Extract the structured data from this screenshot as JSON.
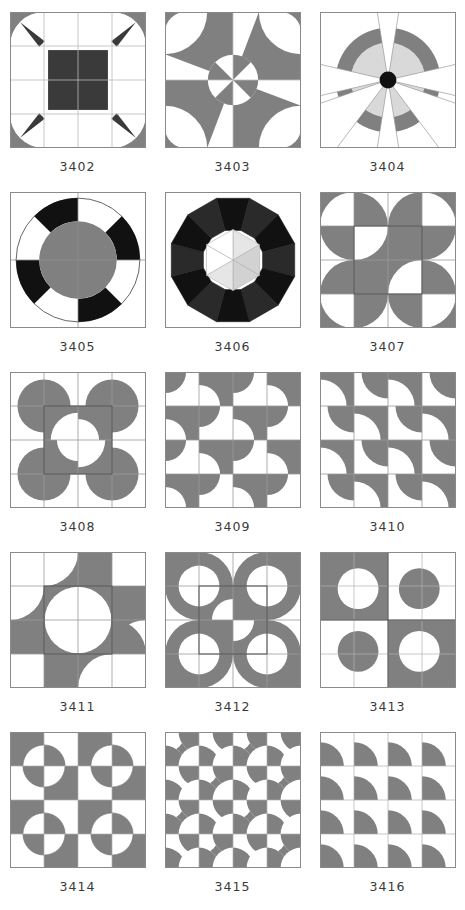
{
  "page": {
    "columns": 3,
    "rows": 5,
    "panel_count": 15
  },
  "colors": {
    "background": "#ffffff",
    "gray": "#808080",
    "light_gray": "#d9d9d9",
    "dark": "#3a3a3a",
    "black": "#111111",
    "grid_line": "#9b9b9b",
    "border": "#8a8a8a",
    "caption": "#3a3a3a"
  },
  "panels": [
    {
      "id": "3402",
      "label": "3402",
      "row": 0,
      "col": 0,
      "grid": "4x4",
      "description": "square cushion with concave arcs, dark center square, gray corner squares, dark spikes"
    },
    {
      "id": "3403",
      "label": "3403",
      "row": 0,
      "col": 1,
      "grid": "2x2",
      "description": "pinwheel star with central circle split in eight gray and white wedges"
    },
    {
      "id": "3404",
      "label": "3404",
      "row": 0,
      "col": 2,
      "grid": "1x1",
      "description": "gray annulus with light gray inner disc, six white radiating wedges, black center dot"
    },
    {
      "id": "3405",
      "label": "3405",
      "row": 1,
      "col": 0,
      "grid": "2x2",
      "description": "ring of alternating black and white segments around a gray disc"
    },
    {
      "id": "3406",
      "label": "3406",
      "row": 1,
      "col": 1,
      "grid": "1x1",
      "description": "dodecagon rosette in black and dark gray with light hexagon of triangles at center"
    },
    {
      "id": "3407",
      "label": "3407",
      "row": 1,
      "col": 2,
      "grid": "4x4",
      "description": "gray S-curve quarter-arc tiles forming a pinwheel cross"
    },
    {
      "id": "3408",
      "label": "3408",
      "row": 2,
      "col": 0,
      "grid": "4x4",
      "description": "gray plus with four bulbous lobed corners, convex and concave quarter circles"
    },
    {
      "id": "3409",
      "label": "3409",
      "row": 2,
      "col": 1,
      "grid": "4x4",
      "description": "repeating gray S-curve tiles, checkerboard orientation"
    },
    {
      "id": "3410",
      "label": "3410",
      "row": 2,
      "col": 2,
      "grid": "4x4",
      "description": "diagonal gray S-curve tiles forming a staircase band"
    },
    {
      "id": "3411",
      "label": "3411",
      "row": 3,
      "col": 0,
      "grid": "4x4",
      "description": "gray ring of S-curve tiles around an open white center"
    },
    {
      "id": "3412",
      "label": "3412",
      "row": 3,
      "col": 1,
      "grid": "4x4",
      "description": "gray cross with white circular lobes at the corners"
    },
    {
      "id": "3413",
      "label": "3413",
      "row": 3,
      "col": 2,
      "grid": "2x2",
      "description": "two-by-two checkerboard with reversed circles in each square"
    },
    {
      "id": "3414",
      "label": "3414",
      "row": 4,
      "col": 0,
      "grid": "4x4",
      "description": "checkerboard of gray and white squares with circles straddling intersections"
    },
    {
      "id": "3415",
      "label": "3415",
      "row": 4,
      "col": 1,
      "grid": "4x4",
      "description": "dense checkerboard with circles at every grid intersection"
    },
    {
      "id": "3416",
      "label": "3416",
      "row": 4,
      "col": 2,
      "grid": "4x4",
      "description": "grid of identical gray quarter-circle fans, one per cell"
    }
  ]
}
